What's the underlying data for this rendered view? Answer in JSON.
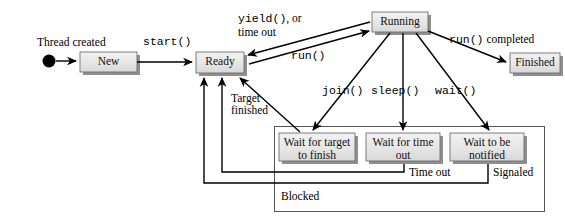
{
  "diagram": {
    "colors": {
      "box_fill": "#e3e3e3",
      "box_fill_light": "#efefef",
      "box_border": "#6e6e6e",
      "box_shadow": "#8a8a8a",
      "line": "#000000",
      "background": "#ffffff"
    },
    "start_marker": {
      "name": "initial-state-dot",
      "label": "Thread created"
    },
    "states": [
      {
        "id": "new",
        "label": "New",
        "lines": [
          "New"
        ]
      },
      {
        "id": "ready",
        "label": "Ready",
        "lines": [
          "Ready"
        ]
      },
      {
        "id": "running",
        "label": "Running",
        "lines": [
          "Running"
        ]
      },
      {
        "id": "finished",
        "label": "Finished",
        "lines": [
          "Finished"
        ]
      },
      {
        "id": "wait_target",
        "label": "Wait for target to finish",
        "lines": [
          "Wait for target",
          "to finish"
        ]
      },
      {
        "id": "wait_time",
        "label": "Wait for time out",
        "lines": [
          "Wait for time",
          "out"
        ]
      },
      {
        "id": "wait_notify",
        "label": "Wait to be notified",
        "lines": [
          "Wait to be",
          "notified"
        ]
      }
    ],
    "group": {
      "id": "blocked",
      "label": "Blocked"
    },
    "transitions": [
      {
        "id": "t-start",
        "from": "new",
        "to": "ready",
        "label": "start()",
        "style": "mono"
      },
      {
        "id": "t-yield",
        "from": "running",
        "to": "ready",
        "label": "yield(), or",
        "label2": "time out",
        "style": "mono-mixed"
      },
      {
        "id": "t-run",
        "from": "ready",
        "to": "running",
        "label": "run()",
        "style": "mono"
      },
      {
        "id": "t-completed",
        "from": "running",
        "to": "finished",
        "label": "run() completed",
        "style": "mono-mixed"
      },
      {
        "id": "t-join",
        "from": "running",
        "to": "wait_target",
        "label": "join()",
        "style": "mono"
      },
      {
        "id": "t-sleep",
        "from": "running",
        "to": "wait_time",
        "label": "sleep()",
        "style": "mono"
      },
      {
        "id": "t-wait",
        "from": "running",
        "to": "wait_notify",
        "label": "wait()",
        "style": "mono"
      },
      {
        "id": "t-target-fin",
        "from": "wait_target",
        "to": "ready",
        "label": "Target",
        "label2": "finished",
        "style": "serif"
      },
      {
        "id": "t-timeout",
        "from": "wait_time",
        "to": "ready",
        "label": "Time out",
        "style": "serif"
      },
      {
        "id": "t-signaled",
        "from": "wait_notify",
        "to": "ready",
        "label": "Signaled",
        "style": "serif"
      }
    ],
    "labels": {
      "thread_created": "Thread created",
      "start": "start()",
      "yield_line1": "yield(), or",
      "yield_1a": "yield()",
      "yield_1b": ", or",
      "yield_line2": "time out",
      "run": "run()",
      "run_completed_a": "run()",
      "run_completed_b": " completed",
      "join": "join()",
      "sleep": "sleep()",
      "wait": "wait()",
      "target_l1": "Target",
      "target_l2": "finished",
      "time_out": "Time out",
      "signaled": "Signaled",
      "blocked": "Blocked",
      "new": "New",
      "ready": "Ready",
      "running": "Running",
      "finished": "Finished",
      "wait_target_l1": "Wait for target",
      "wait_target_l2": "to finish",
      "wait_time_l1": "Wait for time",
      "wait_time_l2": "out",
      "wait_notify_l1": "Wait to be",
      "wait_notify_l2": "notified"
    }
  }
}
